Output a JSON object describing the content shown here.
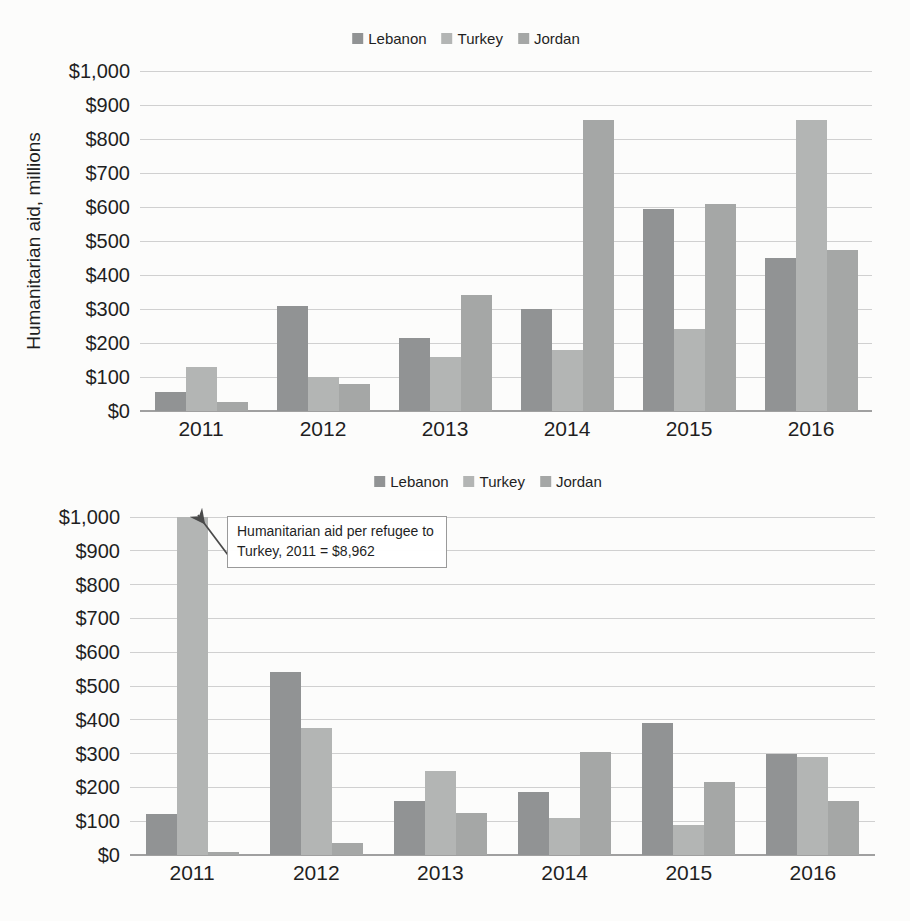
{
  "colors": {
    "page_bg": "#fcfcfb",
    "text": "#1f1f1f",
    "gridline": "#c8c8c8",
    "axis_line": "#a0a0a0",
    "annotation_border": "#9a9a9a",
    "arrow": "#4a4a4a",
    "series": {
      "Lebanon": "#919394",
      "Turkey": "#b3b5b4",
      "Jordan": "#a5a7a6"
    }
  },
  "chart_data": [
    {
      "type": "bar",
      "title": "",
      "xlabel": "",
      "ylabel": "Humanitarian aid, millions",
      "categories": [
        "2011",
        "2012",
        "2013",
        "2014",
        "2015",
        "2016"
      ],
      "series": [
        {
          "name": "Lebanon",
          "values": [
            55,
            310,
            215,
            300,
            595,
            450
          ]
        },
        {
          "name": "Turkey",
          "values": [
            130,
            100,
            160,
            180,
            240,
            855
          ]
        },
        {
          "name": "Jordan",
          "values": [
            27,
            80,
            340,
            855,
            610,
            475
          ]
        }
      ],
      "ylim": [
        0,
        1000
      ],
      "ytick_step": 100,
      "ytick_labels": [
        "$0",
        "$100",
        "$200",
        "$300",
        "$400",
        "$500",
        "$600",
        "$700",
        "$800",
        "$900",
        "$1,000"
      ],
      "legend_position": "top",
      "grid": true
    },
    {
      "type": "bar",
      "title": "",
      "xlabel": "",
      "ylabel": "",
      "categories": [
        "2011",
        "2012",
        "2013",
        "2014",
        "2015",
        "2016"
      ],
      "series": [
        {
          "name": "Lebanon",
          "values": [
            120,
            540,
            160,
            185,
            390,
            300
          ]
        },
        {
          "name": "Turkey",
          "values": [
            8962,
            375,
            250,
            110,
            90,
            290
          ],
          "note": "2011 bar clipped at $1,000 axis maximum; actual value $8,962"
        },
        {
          "name": "Jordan",
          "values": [
            10,
            35,
            125,
            305,
            215,
            160
          ]
        }
      ],
      "ylim": [
        0,
        1000
      ],
      "ytick_step": 100,
      "ytick_labels": [
        "$0",
        "$100",
        "$200",
        "$300",
        "$400",
        "$500",
        "$600",
        "$700",
        "$800",
        "$900",
        "$1,000"
      ],
      "legend_position": "top",
      "grid": true,
      "annotation": {
        "text": "Humanitarian aid per refugee to Turkey, 2011 = $8,962",
        "points_to": "Turkey 2011 bar (clipped at axis maximum)"
      }
    }
  ]
}
